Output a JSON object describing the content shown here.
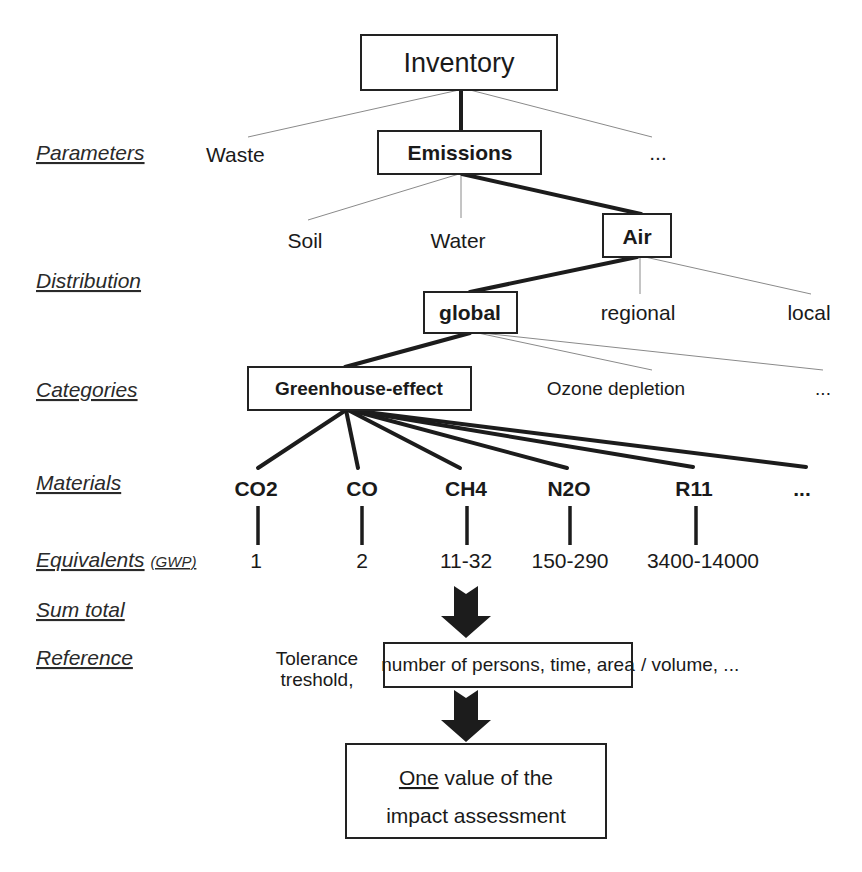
{
  "row_labels": {
    "parameters": "Parameters",
    "distribution": "Distribution",
    "categories": "Categories",
    "materials": "Materials",
    "equivalents": "Equivalents",
    "equivalents_suffix": "(GWP)",
    "sum_total": "Sum total",
    "reference": "Reference"
  },
  "nodes": {
    "inventory": "Inventory",
    "waste": "Waste",
    "emissions": "Emissions",
    "parameters_more": "...",
    "soil": "Soil",
    "water": "Water",
    "air": "Air",
    "global": "global",
    "regional": "regional",
    "local": "local",
    "greenhouse": "Greenhouse-effect",
    "ozone": "Ozone depletion",
    "categories_more": "..."
  },
  "materials": [
    {
      "name": "CO2",
      "gwp": "1"
    },
    {
      "name": "CO",
      "gwp": "2"
    },
    {
      "name": "CH4",
      "gwp": "11-32"
    },
    {
      "name": "N2O",
      "gwp": "150-290"
    },
    {
      "name": "R11",
      "gwp": "3400-14000"
    },
    {
      "name": "...",
      "gwp": ""
    }
  ],
  "reference": {
    "prefix_line1": "Tolerance",
    "prefix_line2": "treshold,",
    "box_text": "number of persons, time, area",
    "suffix": "/  volume, ..."
  },
  "result": {
    "emphasis": "One",
    "line1_rest": " value of the",
    "line2": "impact assessment"
  }
}
